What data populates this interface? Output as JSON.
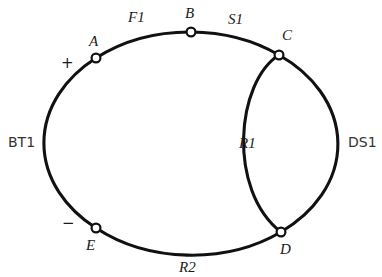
{
  "diagram": {
    "type": "circuit-schematic-loop",
    "title": "",
    "background_color": "#ffffff",
    "line_color": "#111111",
    "node_fill_color": "#ffffff",
    "nodes": [
      {
        "id": "A",
        "label": "A",
        "x": 96,
        "y": 58,
        "label_x": 89,
        "label_y": 34
      },
      {
        "id": "B",
        "label": "B",
        "x": 191,
        "y": 32,
        "label_x": 185,
        "label_y": 6
      },
      {
        "id": "C",
        "label": "C",
        "x": 279,
        "y": 55,
        "label_x": 282,
        "label_y": 28
      },
      {
        "id": "D",
        "label": "D",
        "x": 281,
        "y": 232,
        "label_x": 280,
        "label_y": 242
      },
      {
        "id": "E",
        "label": "E",
        "x": 96,
        "y": 228,
        "label_x": 86,
        "label_y": 238
      }
    ],
    "element_labels": [
      {
        "id": "F1",
        "text": "F1",
        "style": "italic",
        "x": 128,
        "y": 10
      },
      {
        "id": "S1",
        "text": "S1",
        "style": "italic",
        "x": 228,
        "y": 12
      },
      {
        "id": "R1",
        "text": "R1",
        "style": "italic",
        "x": 239,
        "y": 136
      },
      {
        "id": "R2",
        "text": "R2",
        "style": "italic",
        "x": 179,
        "y": 260
      },
      {
        "id": "BT1",
        "text": "BT1",
        "style": "sans",
        "x": 8,
        "y": 135
      },
      {
        "id": "DS1",
        "text": "DS1",
        "style": "sans",
        "x": 348,
        "y": 135
      }
    ],
    "polarity_marks": [
      {
        "id": "plus",
        "text": "+",
        "x": 61,
        "y": 56
      },
      {
        "id": "minus",
        "text": "−",
        "x": 62,
        "y": 216
      }
    ],
    "arcs": [
      {
        "id": "arc-bt1",
        "from": "E",
        "to": "A",
        "component": "BT1"
      },
      {
        "id": "arc-f1",
        "from": "A",
        "to": "B",
        "component": "F1"
      },
      {
        "id": "arc-s1",
        "from": "B",
        "to": "C",
        "component": "S1"
      },
      {
        "id": "arc-ds1",
        "from": "C",
        "to": "D",
        "component": "DS1"
      },
      {
        "id": "arc-r1",
        "from": "C",
        "to": "D",
        "component": "R1"
      },
      {
        "id": "arc-r2",
        "from": "D",
        "to": "E",
        "component": "R2"
      }
    ]
  }
}
